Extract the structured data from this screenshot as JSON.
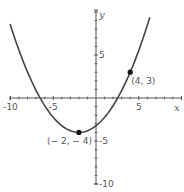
{
  "chart_data": {
    "type": "line",
    "title": "",
    "xlabel": "x",
    "ylabel": "y",
    "xlim": [
      -10,
      10
    ],
    "ylim": [
      -10,
      10
    ],
    "grid": false,
    "x_ticks": [
      -10,
      -5,
      5
    ],
    "x_tick_labels": [
      "-10",
      "-5",
      "5"
    ],
    "y_ticks": [
      5,
      -5,
      -10
    ],
    "y_tick_labels": [
      "5",
      "-5",
      "-10"
    ],
    "minor_tick_step": 1,
    "series": [
      {
        "name": "parabola",
        "equation": "y = (7/36)(x + 2)^2 - 4",
        "x_range": [
          -10.05,
          6.3
        ]
      }
    ],
    "points": [
      {
        "x": 4,
        "y": 3,
        "label": "(4, 3)"
      },
      {
        "x": -2,
        "y": -4,
        "label": "(− 2, − 4)"
      }
    ],
    "colors": {
      "axis": "#555555",
      "curve": "#444444",
      "points": "#111111"
    }
  }
}
